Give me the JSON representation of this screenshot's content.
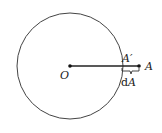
{
  "diagram": {
    "type": "circle-with-radial-segment",
    "colors": {
      "stroke": "#333333",
      "background": "#ffffff"
    },
    "circle": {
      "cx": 70,
      "cy": 66,
      "r": 53
    },
    "points": [
      {
        "id": "O",
        "label": "O",
        "x": 70,
        "y": 66
      },
      {
        "id": "A_prime",
        "label": "A′",
        "x": 122,
        "y": 66
      },
      {
        "id": "A",
        "label": "A",
        "x": 139,
        "y": 66
      }
    ],
    "segment": {
      "from": "O",
      "to": "A"
    },
    "brace": {
      "from": "A_prime",
      "to": "A",
      "label_d": "d",
      "label_var": "A"
    }
  }
}
